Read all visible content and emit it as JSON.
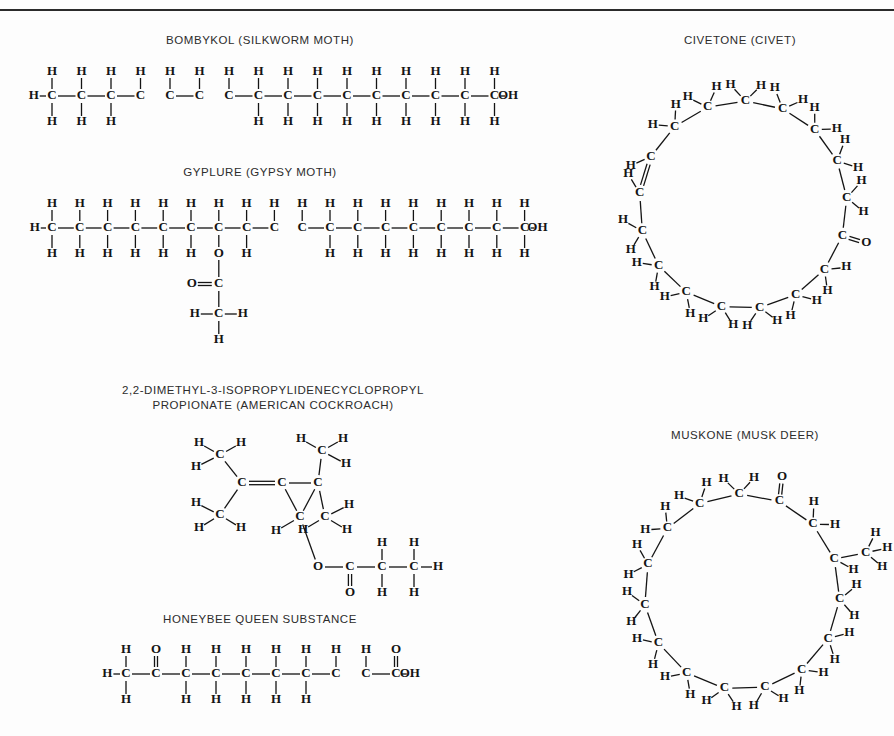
{
  "page": {
    "width": 894,
    "height": 736,
    "background": "#fdfdfd",
    "rule_color": "#2b2b2b",
    "ink_color": "#141414"
  },
  "figures": {
    "bombykol": {
      "caption": "BOMBYKOL (SILKWORM MOTH)",
      "formula_name": "bombykol",
      "chain_label": "H-C-C-C-C=C-C=C-C-C-C-C-C-C-C-C-OH",
      "terminal_group": "OH",
      "carbon_count": 16,
      "double_bond_positions": [
        4,
        6
      ],
      "atoms": {
        "carbon": "C",
        "hydrogen": "H",
        "hydroxyl": "OH"
      }
    },
    "gyplure": {
      "caption": "GYPLURE (GYPSY MOTH)",
      "formula_name": "gyplure",
      "chain_label": "H-C-C-C-C-C-C-C-C-C=C-C-C-C-C-C-C-OH",
      "terminal_group": "OH",
      "carbon_count": 18,
      "double_bond_positions": [
        9
      ],
      "ester_position": 7,
      "ester_oxygen": "O",
      "ester_carbonyl_oxygen": "O",
      "ester_carbonyl_carbon": "C",
      "ester_methyl_carbon": "C",
      "ester_methyl_h_left": "H",
      "ester_methyl_h_right": "H",
      "ester_methyl_h_bottom": "H",
      "atoms": {
        "carbon": "C",
        "hydrogen": "H",
        "hydroxyl": "OH"
      }
    },
    "cockroach": {
      "caption": "2,2-DIMETHYL-3-ISOPROPYLIDENECYCLOPROPYL\nPROPIONATE (AMERICAN COCKROACH)",
      "caption_line1": "2,2-DIMETHYL-3-ISOPROPYLIDENECYCLOPROPYL",
      "caption_line2": "PROPIONATE (AMERICAN COCKROACH)",
      "formula_name": "2,2-dimethyl-3-isopropylidenecyclopropyl propionate",
      "atoms": {
        "carbon": "C",
        "hydrogen": "H",
        "oxygen": "O"
      },
      "ester_link": "O",
      "carbonyl_oxygen": "O",
      "methyl_groups": 4,
      "ring_size": 3
    },
    "honeybee": {
      "caption": "HONEYBEE QUEEN SUBSTANCE",
      "formula_name": "honeybee queen substance",
      "chain_label": "H-C-C(=O)-C-C-C-C-C-C=C-C(=O)-OH",
      "terminal_group": "OH",
      "carbon_count": 10,
      "ketone_position": 2,
      "double_bond_positions": [
        8
      ],
      "atoms": {
        "carbon": "C",
        "hydrogen": "H",
        "oxygen": "O",
        "hydroxyl": "OH"
      }
    },
    "civetone": {
      "caption": "CIVETONE (CIVET)",
      "formula_name": "civetone",
      "ring_size": 17,
      "carbonyl_carbon": "C",
      "carbonyl_oxygen": "O",
      "has_double_bond": true,
      "atoms": {
        "carbon": "C",
        "hydrogen": "H",
        "oxygen": "O"
      }
    },
    "muskone": {
      "caption": "MUSKONE (MUSK DEER)",
      "formula_name": "muskone",
      "ring_size": 15,
      "carbonyl_carbon": "C",
      "carbonyl_oxygen": "O",
      "methyl_group": "C",
      "atoms": {
        "carbon": "C",
        "hydrogen": "H",
        "oxygen": "O"
      }
    }
  },
  "chart_data": {
    "type": "diagram",
    "structures": [
      {
        "name": "BOMBYKOL (SILKWORM MOTH)",
        "kind": "straight-chain",
        "backbone": [
          "C",
          "C",
          "C",
          "C",
          "C",
          "C",
          "C",
          "C",
          "C",
          "C",
          "C",
          "C",
          "C",
          "C",
          "C",
          "C"
        ],
        "bonds": [
          "single",
          "single",
          "single",
          "double",
          "single",
          "double",
          "single",
          "single",
          "single",
          "single",
          "single",
          "single",
          "single",
          "single",
          "single"
        ],
        "left_terminal": "H",
        "right_terminal": "OH"
      },
      {
        "name": "GYPLURE (GYPSY MOTH)",
        "kind": "straight-chain-with-ester-branch",
        "backbone": [
          "C",
          "C",
          "C",
          "C",
          "C",
          "C",
          "C",
          "C",
          "C",
          "C",
          "C",
          "C",
          "C",
          "C",
          "C",
          "C",
          "C",
          "C"
        ],
        "bonds": [
          "single",
          "single",
          "single",
          "single",
          "single",
          "single",
          "single",
          "single",
          "double",
          "single",
          "single",
          "single",
          "single",
          "single",
          "single",
          "single",
          "single"
        ],
        "left_terminal": "H",
        "right_terminal": "OH",
        "branch_at_carbon": 7,
        "branch": [
          "O",
          "C(=O)",
          "CH3"
        ]
      },
      {
        "name": "2,2-DIMETHYL-3-ISOPROPYLIDENECYCLOPROPYL PROPIONATE (AMERICAN COCKROACH)",
        "kind": "cyclopropane-ester",
        "ring_atoms": 3,
        "substituents": [
          "=C(CH3)2",
          "CH3",
          "CH3",
          "O-C(=O)-CH2-CH3"
        ]
      },
      {
        "name": "HONEYBEE QUEEN SUBSTANCE",
        "kind": "straight-chain-keto-acid",
        "backbone": [
          "C",
          "C",
          "C",
          "C",
          "C",
          "C",
          "C",
          "C",
          "C",
          "C"
        ],
        "bonds": [
          "single",
          "single",
          "single",
          "single",
          "single",
          "single",
          "single",
          "double",
          "single"
        ],
        "left_terminal": "H",
        "right_terminal": "OH",
        "ketone_at_carbon": 2,
        "carboxyl_at_carbon": 10
      },
      {
        "name": "CIVETONE (CIVET)",
        "kind": "macrocyclic-ketone",
        "ring_atoms": 17,
        "carbonyl": true,
        "double_bonds": 1
      },
      {
        "name": "MUSKONE (MUSK DEER)",
        "kind": "macrocyclic-ketone",
        "ring_atoms": 15,
        "carbonyl": true,
        "methyl_substituents": 1
      }
    ]
  }
}
